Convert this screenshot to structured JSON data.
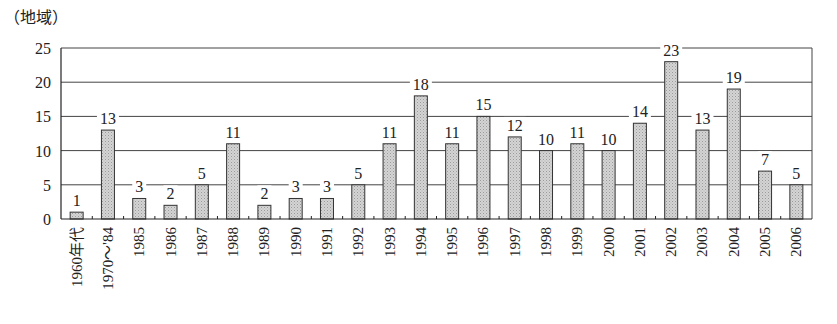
{
  "chart_data": {
    "type": "bar",
    "title": "",
    "unit_label": "（地域）",
    "xlabel": "",
    "ylabel": "（地域）",
    "ylim": [
      0,
      25
    ],
    "yticks": [
      0,
      5,
      10,
      15,
      20,
      25
    ],
    "grid": true,
    "legend": null,
    "categories": [
      "1960年代",
      "1970～'84",
      "1985",
      "1986",
      "1987",
      "1988",
      "1989",
      "1990",
      "1991",
      "1992",
      "1993",
      "1994",
      "1995",
      "1996",
      "1997",
      "1998",
      "1999",
      "2000",
      "2001",
      "2002",
      "2003",
      "2004",
      "2005",
      "2006"
    ],
    "values": [
      1,
      13,
      3,
      2,
      5,
      11,
      2,
      3,
      3,
      5,
      11,
      18,
      11,
      15,
      12,
      10,
      11,
      10,
      14,
      23,
      13,
      19,
      7,
      5
    ],
    "bar_color": "#c8c8c8",
    "bar_edge_color": "#333333",
    "grid_color": "#444444"
  }
}
